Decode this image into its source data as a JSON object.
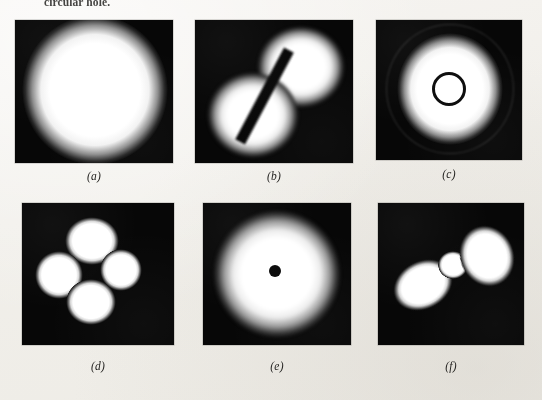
{
  "page": {
    "running_caption": "circular hole.",
    "background_color": "#f3f1ed",
    "plate_color": "#070707",
    "lobe_color": "#ffffff"
  },
  "figure": {
    "rows": 2,
    "columns": 3,
    "panels": [
      {
        "id": "a",
        "label": "(a)",
        "description": "Uniform bright circular disk filling most of the dark field",
        "pattern": "airy-disk-uniform",
        "lobe_count": 1
      },
      {
        "id": "b",
        "label": "(b)",
        "description": "Two bright lobes separated by a dark diagonal nodal line",
        "pattern": "two-lobe-diagonal",
        "lobe_count": 2
      },
      {
        "id": "c",
        "label": "(c)",
        "description": "Bright disk with a dark circular ring at the centre",
        "pattern": "disk-with-dark-ring",
        "lobe_count": 1
      },
      {
        "id": "d",
        "label": "(d)",
        "description": "Four bright lobes arranged in a clover-leaf quadrupole",
        "pattern": "four-lobe-clover",
        "lobe_count": 4
      },
      {
        "id": "e",
        "label": "(e)",
        "description": "Bright disk with a small dark dot at the centre",
        "pattern": "disk-with-dark-dot",
        "lobe_count": 1
      },
      {
        "id": "f",
        "label": "(f)",
        "description": "Three bright lobes in a diagonal row, centre lobe smallest",
        "pattern": "three-lobe-diagonal",
        "lobe_count": 3
      }
    ]
  }
}
